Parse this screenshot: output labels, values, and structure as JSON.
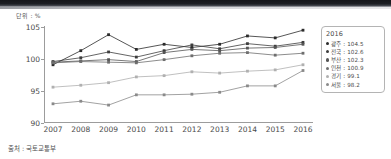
{
  "unit_label": "단위 : %",
  "source_note": "출처 : 국토교통부",
  "legend": {
    "title": "2016",
    "entries": [
      {
        "label": "광주",
        "value": "104.5",
        "color": "#2b2b2b"
      },
      {
        "label": "전국",
        "value": "102.6",
        "color": "#3d3d3d"
      },
      {
        "label": "부산",
        "value": "102.3",
        "color": "#555555"
      },
      {
        "label": "인천",
        "value": "100.9",
        "color": "#6e6e6e"
      },
      {
        "label": "경기",
        "value": "99.1",
        "color": "#b0b0b0"
      },
      {
        "label": "서울",
        "value": "98.2",
        "color": "#8a8a8a"
      }
    ]
  },
  "chart_data": {
    "type": "line",
    "title": "",
    "subtitle": "",
    "xlabel": "",
    "ylabel": "단위 : %",
    "grid": false,
    "legend_position": "right",
    "x": [
      2007,
      2008,
      2009,
      2010,
      2011,
      2012,
      2013,
      2014,
      2015,
      2016
    ],
    "xtick_labels": [
      "2007",
      "2008",
      "2009",
      "2010",
      "2011",
      "2012",
      "2013",
      "2014",
      "2015",
      "2016"
    ],
    "ytick_labels": [
      "90",
      "95",
      "100",
      "105"
    ],
    "yticks": [
      90,
      95,
      100,
      105
    ],
    "ylim": [
      90,
      105
    ],
    "xlim": [
      2007,
      2016
    ],
    "series": [
      {
        "name": "광주",
        "color": "#2b2b2b",
        "values": [
          99.1,
          101.3,
          103.8,
          101.5,
          102.3,
          101.8,
          102.3,
          103.6,
          103.3,
          104.5
        ]
      },
      {
        "name": "전국",
        "color": "#3d3d3d",
        "values": [
          99.6,
          100.2,
          101.1,
          100.3,
          101.3,
          102.2,
          101.6,
          102.4,
          102.0,
          102.6
        ]
      },
      {
        "name": "부산",
        "color": "#555555",
        "values": [
          99.5,
          99.7,
          99.9,
          99.6,
          101.0,
          101.5,
          101.3,
          101.7,
          101.8,
          102.3
        ]
      },
      {
        "name": "인천",
        "color": "#6e6e6e",
        "values": [
          99.4,
          99.6,
          99.5,
          99.4,
          99.9,
          100.5,
          100.9,
          101.0,
          100.6,
          100.9
        ]
      },
      {
        "name": "경기",
        "color": "#b0b0b0",
        "values": [
          95.6,
          95.9,
          96.3,
          97.2,
          97.4,
          98.0,
          97.8,
          98.1,
          98.3,
          99.1
        ]
      },
      {
        "name": "서울",
        "color": "#8a8a8a",
        "values": [
          93.0,
          93.4,
          92.8,
          94.4,
          94.4,
          94.5,
          94.8,
          95.8,
          95.8,
          98.2
        ]
      }
    ]
  }
}
